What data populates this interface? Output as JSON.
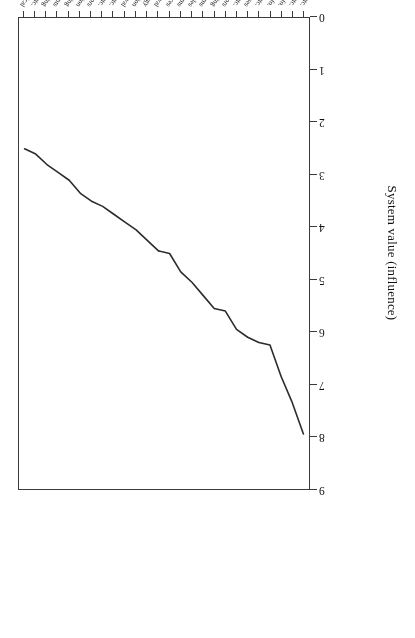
{
  "chart_data": {
    "type": "line",
    "title": "",
    "xlabel": "",
    "ylabel": "System value (influence)",
    "ylim": [
      0,
      9
    ],
    "yticks": [
      0,
      1,
      2,
      3,
      4,
      5,
      6,
      7,
      8,
      9
    ],
    "grid": false,
    "legend": "none",
    "rotation": "figure printed upside-down (180 degrees)",
    "line_color": "#2b2b2b",
    "categories": [
      "Semiconductor Device Manufacturing etc.",
      "Electricity: Electrical Systems etc.",
      "Incremental Printing of Symbolic Info.",
      "Optics: Systems and Symbolic Info.",
      "Metal Working etc.",
      "Etching a Substrate: Processes",
      "Adhesive Bonding etc.",
      "Electrical Resistors",
      "Measuring and Testing",
      "Selective Visual Display Systems",
      "Stock Material or Miscellaneous Articles",
      "Electrical (Generator or Motor) Systems",
      "Active Solid-State Devices",
      "Dynamic Information Storage or Retrieval",
      "Radiant Energy",
      "Valves and Valve Actuation",
      "Static Information Storage and Retrieval",
      "Radiation Imagery Chemistry etc.",
      "Electricity: Chemistry etc.",
      "Optics: Image Projectors",
      "Television",
      "Measuring and Testing",
      "Power Plants",
      "Electrical Audio Signal Processing",
      "Electricity: Magnetically Operated etc.",
      "Communications: Electrical"
    ],
    "values": [
      7.95,
      7.35,
      6.85,
      6.25,
      6.2,
      6.1,
      5.95,
      5.6,
      5.55,
      5.3,
      5.05,
      4.85,
      4.5,
      4.45,
      4.25,
      4.05,
      3.9,
      3.75,
      3.6,
      3.5,
      3.35,
      3.1,
      2.95,
      2.8,
      2.6,
      2.5
    ]
  },
  "axis": {
    "y_title": "System value (influence)",
    "y_tick_labels": [
      "0",
      "1",
      "2",
      "3",
      "4",
      "5",
      "6",
      "7",
      "8",
      "9"
    ]
  }
}
